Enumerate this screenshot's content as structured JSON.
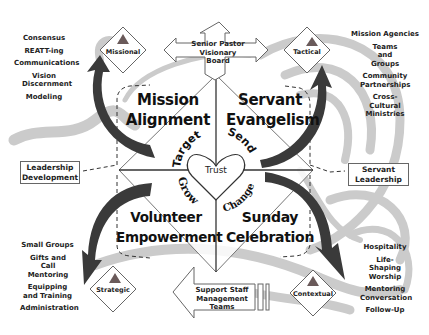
{
  "diagram": {
    "center": {
      "label": "Trust",
      "shape": "heart"
    },
    "quadrants": [
      {
        "id": "top-left",
        "title_line1": "Mission",
        "title_line2": "Alignment",
        "verb": "Target"
      },
      {
        "id": "top-right",
        "title_line1": "Servant",
        "title_line2": "Evangelism",
        "verb": "Send"
      },
      {
        "id": "bottom-left",
        "title_line1": "Volunteer",
        "title_line2": "Empowerment",
        "verb": "Grow"
      },
      {
        "id": "bottom-right",
        "title_line1": "Sunday",
        "title_line2": "Celebration",
        "verb": "Change"
      }
    ],
    "top_arrow": {
      "line1": "Senior Pastor",
      "line2": "Visionary",
      "line3": "Board"
    },
    "bottom_arrow": {
      "line1": "Support Staff",
      "line2": "Management",
      "line3": "Teams"
    },
    "side_boxes": {
      "left": {
        "line1": "Leadership",
        "line2": "Development"
      },
      "right": {
        "line1": "Servant",
        "line2": "Leadership"
      }
    },
    "diamonds": {
      "top_left": "Missional",
      "top_right": "Tactical",
      "bottom_left": "Strategic",
      "bottom_right": "Contextual"
    },
    "lists": {
      "top_left": [
        "Consensus",
        "REATT-ing",
        "Communications",
        "Vision Discernment",
        "Modeling"
      ],
      "top_right": [
        "Mission Agencies",
        "Teams and Groups",
        "Community Partnerships",
        "Cross-Cultural Ministries"
      ],
      "bottom_left": [
        "Small Groups",
        "Gifts and Call Mentoring",
        "Equipping and Training",
        "Administration"
      ],
      "bottom_right": [
        "Hospitality",
        "Life-Shaping Worship",
        "Mentoring Conversation",
        "Follow-Up"
      ]
    },
    "colors": {
      "dark_arrow": "#3a3a3a",
      "swirl_gray": "#c8c8c8",
      "triangle": "#6a5a5a",
      "outline": "#555555"
    }
  }
}
